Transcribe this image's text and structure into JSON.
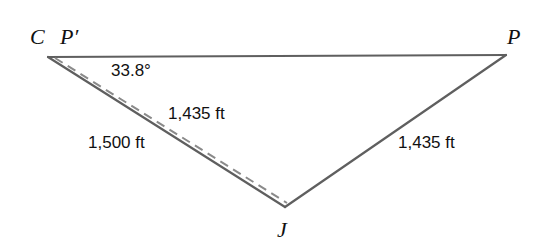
{
  "diagram": {
    "type": "geometry-triangle",
    "background_color": "#ffffff",
    "stroke_color": "#5f5f5f",
    "dashed_stroke_color": "#8a8a8a",
    "text_color": "#111111",
    "vertices": {
      "c": {
        "label": "C",
        "x": 48,
        "y": 57
      },
      "p_prime": {
        "label": "P′",
        "x": 68,
        "y": 61
      },
      "p": {
        "label": "P",
        "x": 506,
        "y": 56
      },
      "j": {
        "label": "J",
        "x": 285,
        "y": 207
      }
    },
    "angle": {
      "label": "33.8°",
      "value": 33.8,
      "unit": "degrees",
      "at_vertex": "C"
    },
    "measurements": {
      "dashed_segment": "1,435 ft",
      "solid_left_segment": "1,500 ft",
      "right_segment": "1,435 ft"
    }
  }
}
